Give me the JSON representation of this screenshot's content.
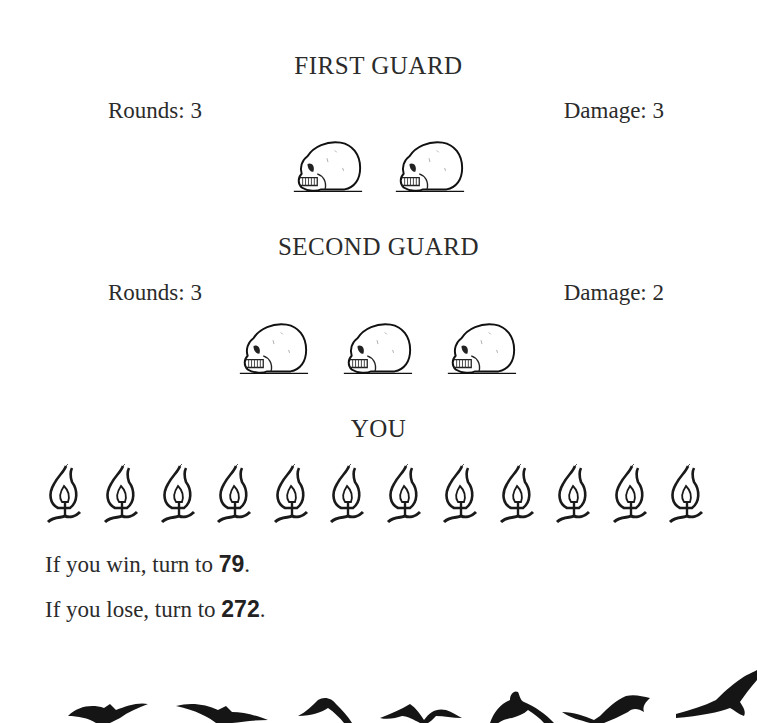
{
  "combat": {
    "enemies": [
      {
        "name": "FIRST GUARD",
        "rounds_label": "Rounds: 3",
        "damage_label": "Damage: 3",
        "rounds": 3,
        "damage": 3,
        "health_icon": "skull-icon",
        "health_count": 2
      },
      {
        "name": "SECOND GUARD",
        "rounds_label": "Rounds: 3",
        "damage_label": "Damage: 2",
        "rounds": 3,
        "damage": 2,
        "health_icon": "skull-icon",
        "health_count": 3
      }
    ],
    "player": {
      "name": "YOU",
      "health_icon": "flame-icon",
      "health_count": 12
    }
  },
  "outcomes": [
    {
      "prefix": "If you win, turn to ",
      "section": "79",
      "suffix": "."
    },
    {
      "prefix": "If you lose, turn to ",
      "section": "272",
      "suffix": "."
    }
  ],
  "decoration": {
    "icon": "ravens-flight-icon",
    "count": 7
  },
  "colors": {
    "text": "#2b2b2b",
    "ink": "#1a1a1a",
    "background": "#ffffff"
  }
}
